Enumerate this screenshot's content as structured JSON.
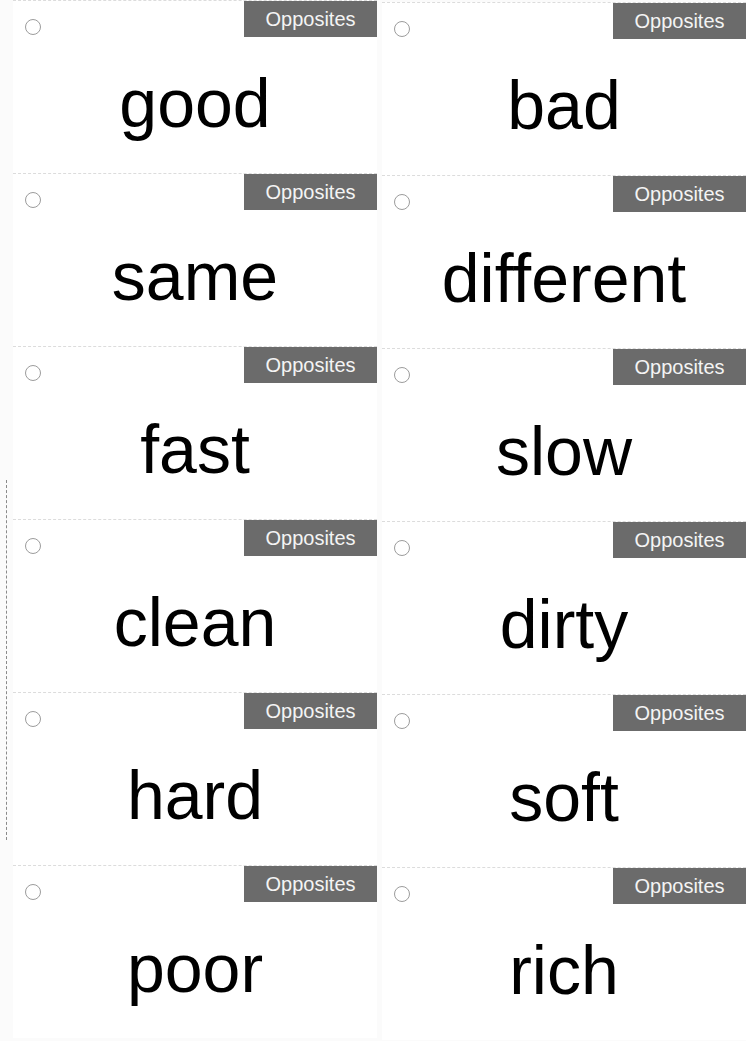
{
  "sheet": {
    "category_label": "Opposites",
    "badge_color": "#6b6b6b",
    "cards": [
      {
        "word": "good",
        "category": "Opposites"
      },
      {
        "word": "bad",
        "category": "Opposites"
      },
      {
        "word": "same",
        "category": "Opposites"
      },
      {
        "word": "different",
        "category": "Opposites"
      },
      {
        "word": "fast",
        "category": "Opposites"
      },
      {
        "word": "slow",
        "category": "Opposites"
      },
      {
        "word": "clean",
        "category": "Opposites"
      },
      {
        "word": "dirty",
        "category": "Opposites"
      },
      {
        "word": "hard",
        "category": "Opposites"
      },
      {
        "word": "soft",
        "category": "Opposites"
      },
      {
        "word": "poor",
        "category": "Opposites"
      },
      {
        "word": "rich",
        "category": "Opposites"
      }
    ]
  }
}
